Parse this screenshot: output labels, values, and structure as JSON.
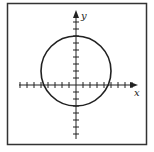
{
  "figure": {
    "type": "coordinate-plane-graph",
    "axes": {
      "x_label": "x",
      "y_label": "y",
      "x_ticks": [
        -8,
        -7,
        -6,
        -5,
        -4,
        -3,
        -2,
        -1,
        1,
        2,
        3,
        4,
        5,
        6,
        7,
        8
      ],
      "y_ticks": [
        -7,
        -6,
        -5,
        -4,
        -3,
        -2,
        -1,
        1,
        2,
        3,
        4,
        5,
        6,
        7,
        8,
        9
      ],
      "tick_labels_shown": false
    },
    "curve": {
      "shape": "circle",
      "center": [
        0,
        2
      ],
      "radius": 5
    },
    "colors": {
      "stroke": "#222222",
      "border": "#333333",
      "background": "#ffffff"
    }
  },
  "chart_data": {
    "type": "line",
    "title": "",
    "xlabel": "x",
    "ylabel": "y",
    "xlim": [
      -8,
      8.7
    ],
    "ylim": [
      -7.5,
      10.5
    ],
    "grid": false,
    "series": [
      {
        "name": "circle",
        "equation": "x^2 + (y - 2)^2 = 25",
        "center": [
          0,
          2
        ],
        "radius": 5
      }
    ],
    "annotations": [
      "x",
      "y"
    ]
  }
}
